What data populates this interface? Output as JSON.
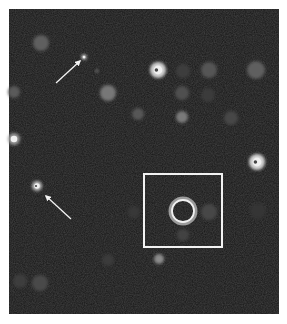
{
  "figure": {
    "frame": {
      "x": 9,
      "y": 9,
      "width": 270,
      "height": 305,
      "background": "#161616",
      "border": "#f2f2f2"
    },
    "colors": {
      "annotation": "#f4f4f4"
    },
    "cells": [
      {
        "cx": 41,
        "cy": 43,
        "r": 8,
        "fill": "#5e5e5e",
        "type": "dim"
      },
      {
        "cx": 84,
        "cy": 57,
        "r": 2.5,
        "fill": "#d8d8d8",
        "type": "bright-dot"
      },
      {
        "cx": 97,
        "cy": 71,
        "r": 1.5,
        "fill": "#8a8a8a",
        "type": "dot"
      },
      {
        "cx": 108,
        "cy": 93,
        "r": 8,
        "fill": "#777777",
        "type": "medium"
      },
      {
        "cx": 138,
        "cy": 114,
        "r": 6,
        "fill": "#575757",
        "type": "dim"
      },
      {
        "cx": 14,
        "cy": 92,
        "r": 6,
        "fill": "#5a5a5a",
        "type": "dim-edge"
      },
      {
        "cx": 14,
        "cy": 139,
        "r": 6,
        "fill": "#9a9a9a",
        "type": "bright-edge"
      },
      {
        "cx": 158,
        "cy": 70,
        "r": 8,
        "fill": "#d0d0d0",
        "type": "bright-mitotic"
      },
      {
        "cx": 183,
        "cy": 71,
        "r": 7,
        "fill": "#3e3e3e",
        "type": "faint"
      },
      {
        "cx": 209,
        "cy": 70,
        "r": 8,
        "fill": "#555555",
        "type": "dim"
      },
      {
        "cx": 256,
        "cy": 70,
        "r": 9,
        "fill": "#5f5f5f",
        "type": "dim"
      },
      {
        "cx": 182,
        "cy": 93,
        "r": 7,
        "fill": "#505050",
        "type": "dim"
      },
      {
        "cx": 208,
        "cy": 95,
        "r": 7,
        "fill": "#3a3a3a",
        "type": "faint"
      },
      {
        "cx": 182,
        "cy": 117,
        "r": 6,
        "fill": "#7a7a7a",
        "type": "medium"
      },
      {
        "cx": 231,
        "cy": 118,
        "r": 7,
        "fill": "#464646",
        "type": "faint"
      },
      {
        "cx": 257,
        "cy": 162,
        "r": 8,
        "fill": "#d4d4d4",
        "type": "bright-mitotic"
      },
      {
        "cx": 37,
        "cy": 186,
        "r": 5,
        "fill": "#bcbcbc",
        "type": "bright-ring"
      },
      {
        "cx": 134,
        "cy": 212,
        "r": 6,
        "fill": "#383838",
        "type": "faint"
      },
      {
        "cx": 209,
        "cy": 212,
        "r": 8,
        "fill": "#474747",
        "type": "faint"
      },
      {
        "cx": 183,
        "cy": 235,
        "r": 6,
        "fill": "#434343",
        "type": "faint"
      },
      {
        "cx": 258,
        "cy": 211,
        "r": 8,
        "fill": "#363636",
        "type": "faint"
      },
      {
        "cx": 159,
        "cy": 259,
        "r": 5,
        "fill": "#8c8c8c",
        "type": "medium"
      },
      {
        "cx": 108,
        "cy": 260,
        "r": 6,
        "fill": "#3a3a3a",
        "type": "faint"
      },
      {
        "cx": 20,
        "cy": 281,
        "r": 7,
        "fill": "#3c3c3c",
        "type": "faint"
      },
      {
        "cx": 40,
        "cy": 283,
        "r": 8,
        "fill": "#4a4a4a",
        "type": "dim"
      }
    ],
    "arrows": [
      {
        "x1": 56,
        "y1": 83,
        "x2": 80,
        "y2": 61,
        "label": "arrow-upper-left"
      },
      {
        "x1": 71,
        "y1": 219,
        "x2": 46,
        "y2": 196,
        "label": "arrow-lower-left"
      }
    ],
    "roi_box": {
      "x": 144,
      "y": 174,
      "width": 78,
      "height": 73
    },
    "roi_circle": {
      "cx": 183,
      "cy": 211,
      "r": 11,
      "stroke_inner": "#f0f0f0",
      "stroke_outer": "#9a9a9a"
    }
  }
}
